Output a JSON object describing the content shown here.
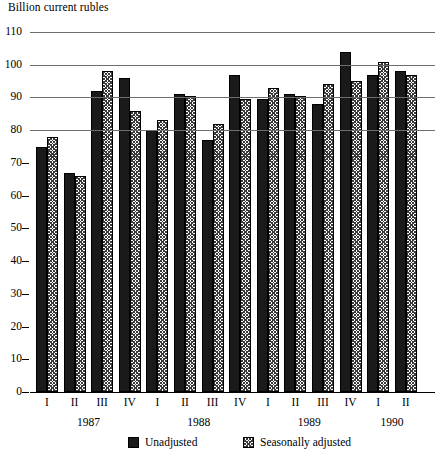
{
  "chart_data": {
    "type": "bar",
    "title": "",
    "ylabel": "Billion current rubles",
    "xlabel": "",
    "ylim": [
      0,
      110
    ],
    "ytick_step": 10,
    "yticks": [
      0,
      10,
      20,
      30,
      40,
      50,
      60,
      70,
      80,
      90,
      100,
      110
    ],
    "grid": true,
    "gridlines_at": [
      80,
      90,
      100,
      110
    ],
    "legend_position": "bottom",
    "categories": [
      "I",
      "II",
      "III",
      "IV",
      "I",
      "II",
      "III",
      "IV",
      "I",
      "II",
      "III",
      "IV",
      "I",
      "II"
    ],
    "group_labels": [
      "1987",
      "1988",
      "1989",
      "1990"
    ],
    "groups": [
      {
        "year": "1987",
        "quarters": [
          "I",
          "II",
          "III",
          "IV"
        ]
      },
      {
        "year": "1988",
        "quarters": [
          "I",
          "II",
          "III",
          "IV"
        ]
      },
      {
        "year": "1989",
        "quarters": [
          "I",
          "II",
          "III",
          "IV"
        ]
      },
      {
        "year": "1990",
        "quarters": [
          "I",
          "II"
        ]
      }
    ],
    "series": [
      {
        "name": "Unadjusted",
        "color": "#1a1a1a",
        "pattern": "solid",
        "values": [
          75,
          67,
          92,
          96,
          80,
          91,
          77,
          97,
          89.5,
          91,
          88,
          104,
          97,
          98
        ]
      },
      {
        "name": "Seasonally adjusted",
        "color": "#ffffff",
        "pattern": "crosshatch",
        "values": [
          78,
          66,
          98,
          86,
          83,
          90.5,
          82,
          89.5,
          93,
          90.5,
          94,
          95,
          101,
          97
        ]
      }
    ]
  },
  "legend": {
    "items": [
      {
        "label": "Unadjusted"
      },
      {
        "label": "Seasonally adjusted"
      }
    ]
  }
}
